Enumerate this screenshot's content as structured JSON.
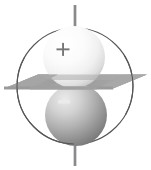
{
  "figure": {
    "name": "electric-dipole-with-equipotential-plane",
    "background_color": "#ffffff",
    "width": 151,
    "height": 170
  },
  "chart_data": {
    "type": "diagram",
    "title": "",
    "subtitle": "",
    "xlabel": "",
    "ylabel": "",
    "annotations": [
      {
        "text": "+",
        "x": 62,
        "y": 50,
        "role": "positive-charge-label"
      },
      {
        "text": "−",
        "x": 64,
        "y": 102,
        "role": "negative-charge-label"
      }
    ],
    "elements": [
      {
        "name": "bounding-circle",
        "shape": "circle",
        "cx": 75,
        "cy": 86,
        "r": 58,
        "stroke": "#55555a",
        "fill": "none"
      },
      {
        "name": "dipole-axis",
        "shape": "line",
        "x1": 75,
        "y1": 5,
        "x2": 75,
        "y2": 166,
        "stroke": "#8a8a8e"
      },
      {
        "name": "positive-sphere",
        "shape": "sphere",
        "cx": 74,
        "cy": 57,
        "r": 31,
        "fill_light": "#ffffff",
        "fill_dark": "#c9c9c9",
        "charge": "+"
      },
      {
        "name": "negative-sphere",
        "shape": "sphere",
        "cx": 76,
        "cy": 115,
        "r": 31,
        "fill_light": "#e2e2e2",
        "fill_dark": "#7f7f7f",
        "charge": "−"
      },
      {
        "name": "bisecting-plane",
        "shape": "parallelogram",
        "fill": "#9d9d9d",
        "points": "4,89 38,75 147,75 113,89"
      }
    ]
  },
  "colors": {
    "background": "#ffffff",
    "circle_stroke": "#55555a",
    "axis_stroke": "#8a8a8e",
    "plane_fill": "#9d9d9d",
    "plane_fill_light": "#b0b0b0",
    "positive_sphere_light": "#ffffff",
    "positive_sphere_mid": "#f2f2f2",
    "positive_sphere_dark": "#c4c4c4",
    "negative_sphere_light": "#e6e6e6",
    "negative_sphere_mid": "#b4b4b4",
    "negative_sphere_dark": "#7a7a7a",
    "sign_label": "#6e6e6e",
    "minus_label": "#e8e8e8"
  },
  "labels": {
    "positive": "+",
    "negative": "−"
  }
}
